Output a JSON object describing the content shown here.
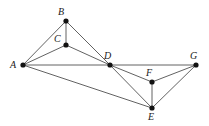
{
  "figure": {
    "kind": "undirected-graph-diagram",
    "background_color": "#ffffff",
    "edge_color": "#3a3a3a",
    "vertex_color": "#121212",
    "label_color": "#1a1a1a",
    "width": 209,
    "height": 126
  },
  "chart_data": {
    "type": "diagram",
    "title": "",
    "xlabel": "",
    "ylabel": "",
    "graph_type": "undirected",
    "vertex_count": 7,
    "edge_count": 13,
    "nodes": [
      {
        "id": "A",
        "label": "A",
        "x": 23,
        "y": 65,
        "label_x": 10,
        "label_y": 60,
        "degree": 4
      },
      {
        "id": "B",
        "label": "B",
        "x": 66,
        "y": 21,
        "label_x": 58,
        "label_y": 7,
        "degree": 3
      },
      {
        "id": "C",
        "label": "C",
        "x": 66,
        "y": 45,
        "label_x": 54,
        "label_y": 34,
        "degree": 3
      },
      {
        "id": "D",
        "label": "D",
        "x": 110,
        "y": 65,
        "label_x": 104,
        "label_y": 51,
        "degree": 6
      },
      {
        "id": "E",
        "label": "E",
        "x": 152,
        "y": 108,
        "label_x": 148,
        "label_y": 112,
        "degree": 4
      },
      {
        "id": "F",
        "label": "F",
        "x": 152,
        "y": 82,
        "label_x": 146,
        "label_y": 68,
        "degree": 3
      },
      {
        "id": "G",
        "label": "G",
        "x": 196,
        "y": 65,
        "label_x": 190,
        "label_y": 51,
        "degree": 3
      }
    ],
    "edges": [
      {
        "from": "A",
        "to": "B"
      },
      {
        "from": "A",
        "to": "C"
      },
      {
        "from": "A",
        "to": "D"
      },
      {
        "from": "A",
        "to": "E"
      },
      {
        "from": "B",
        "to": "C"
      },
      {
        "from": "B",
        "to": "D"
      },
      {
        "from": "C",
        "to": "D"
      },
      {
        "from": "D",
        "to": "E"
      },
      {
        "from": "D",
        "to": "F"
      },
      {
        "from": "D",
        "to": "G"
      },
      {
        "from": "E",
        "to": "F"
      },
      {
        "from": "E",
        "to": "G"
      },
      {
        "from": "F",
        "to": "G"
      }
    ]
  }
}
